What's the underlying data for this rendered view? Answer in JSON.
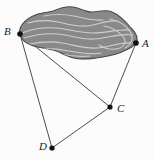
{
  "figure": {
    "type": "geometry-diagram",
    "background_color": "#fdfdfd",
    "region": {
      "name": "shaded-lake-region",
      "fill_color": "#8a8a8a",
      "stroke_color": "#4a4a4a",
      "contour_line_color": "#cfcfcf",
      "contour_count": 9
    },
    "points": [
      {
        "id": "B",
        "label": "B",
        "x": 20,
        "y": 34,
        "label_x": 4,
        "label_y": 26
      },
      {
        "id": "A",
        "label": "A",
        "x": 136,
        "y": 43,
        "label_x": 142,
        "label_y": 38
      },
      {
        "id": "C",
        "label": "C",
        "x": 110,
        "y": 107,
        "label_x": 117,
        "label_y": 103
      },
      {
        "id": "D",
        "label": "D",
        "x": 52,
        "y": 148,
        "label_x": 39,
        "label_y": 141
      }
    ],
    "segments": [
      {
        "from": "B",
        "to": "A",
        "name": "segment-ba"
      },
      {
        "from": "B",
        "to": "C",
        "name": "segment-bc"
      },
      {
        "from": "B",
        "to": "D",
        "name": "segment-bd"
      },
      {
        "from": "A",
        "to": "C",
        "name": "segment-ac"
      },
      {
        "from": "C",
        "to": "D",
        "name": "segment-cd"
      }
    ],
    "line_color": "#3a3a3a",
    "point_color": "#111111",
    "point_radius": 2.6
  }
}
